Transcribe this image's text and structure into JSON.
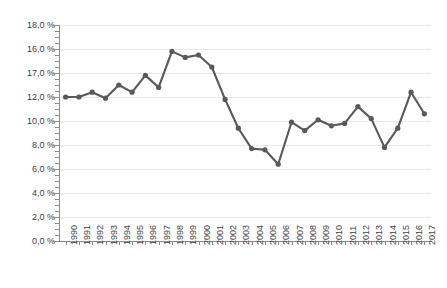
{
  "chart_data": {
    "type": "line",
    "title": "",
    "xlabel": "",
    "ylabel": "",
    "grid": true,
    "legend": false,
    "line_color": "#595959",
    "marker_color": "#595959",
    "ylim": [
      0,
      18
    ],
    "ytick_step": 2,
    "ytick_labels": [
      "18,0 %",
      "16,0 %",
      "17,0 %",
      "12,0 %",
      "10,0 %",
      "8,0 %",
      "6,0 %",
      "4,0 %",
      "2,0 %",
      "0,0 %"
    ],
    "ytick_values": [
      18,
      16,
      14,
      12,
      10,
      8,
      6,
      4,
      2,
      0
    ],
    "categories": [
      "1990",
      "1991",
      "1992",
      "1993",
      "1994",
      "1995",
      "1996",
      "1997",
      "1998",
      "1999",
      "2000",
      "2001",
      "2002",
      "2003",
      "2004",
      "2005",
      "2006",
      "2007",
      "2008",
      "2009",
      "2010",
      "2011",
      "2012",
      "2013",
      "2014",
      "2015",
      "2016",
      "2017"
    ],
    "values": [
      12.0,
      12.0,
      12.4,
      11.9,
      13.0,
      12.4,
      13.8,
      12.8,
      15.8,
      15.3,
      15.5,
      14.5,
      11.8,
      9.4,
      7.7,
      7.6,
      6.4,
      9.9,
      9.2,
      10.1,
      9.6,
      9.8,
      11.2,
      10.2,
      7.8,
      9.4,
      12.4,
      10.6
    ],
    "values_display": [
      "12,0 %",
      "12,0 %",
      "12,4 %",
      "11,9 %",
      "13,0 %",
      "12,4 %",
      "13,8 %",
      "12,8 %",
      "15,8 %",
      "15,3 %",
      "15,5 %",
      "14,5 %",
      "11,8 %",
      "9,4 %",
      "7,7 %",
      "7,6 %",
      "6,4 %",
      "9,9 %",
      "9,2 %",
      "10,1 %",
      "9,6 %",
      "9,8 %",
      "11,2 %",
      "10,2 %",
      "7,8 %",
      "9,4 %",
      "12,4 %",
      "10,6 %"
    ]
  }
}
